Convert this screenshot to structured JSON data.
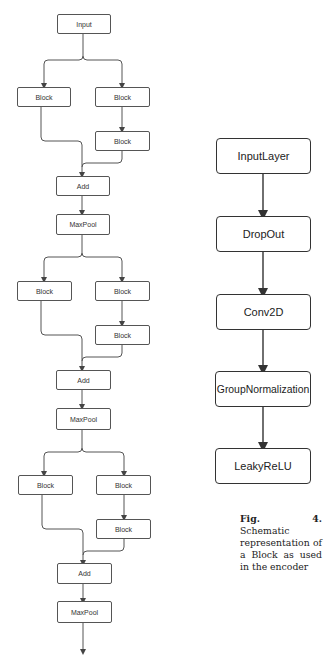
{
  "left_diagram": {
    "input_label": "Input",
    "stages": [
      {
        "block_left": "Block",
        "block_right": "Block",
        "block_right_2": "Block",
        "add": "Add",
        "pool": "MaxPool"
      },
      {
        "block_left": "Block",
        "block_right": "Block",
        "block_right_2": "Block",
        "add": "Add",
        "pool": "MaxPool"
      },
      {
        "block_left": "Block",
        "block_right": "Block",
        "block_right_2": "Block",
        "add": "Add",
        "pool": "MaxPool"
      }
    ]
  },
  "right_diagram": {
    "layers": [
      "InputLayer",
      "DropOut",
      "Conv2D",
      "GroupNormalization",
      "LeakyReLU"
    ]
  },
  "caption": {
    "label": "Fig. 4.",
    "text": "Schematic representation of a Block as used in the encoder"
  }
}
